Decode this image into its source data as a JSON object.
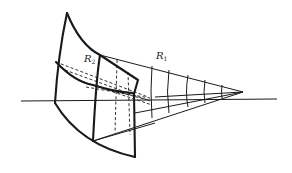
{
  "diagram": {
    "title": "",
    "labels": [
      {
        "id": "R2",
        "main": "R",
        "sub": "2",
        "x": 84,
        "y": 54
      },
      {
        "id": "R1",
        "main": "R",
        "sub": "1",
        "x": 156,
        "y": 51
      }
    ],
    "colors": {
      "stroke": "#1a1a1a",
      "background": "#ffffff"
    }
  }
}
